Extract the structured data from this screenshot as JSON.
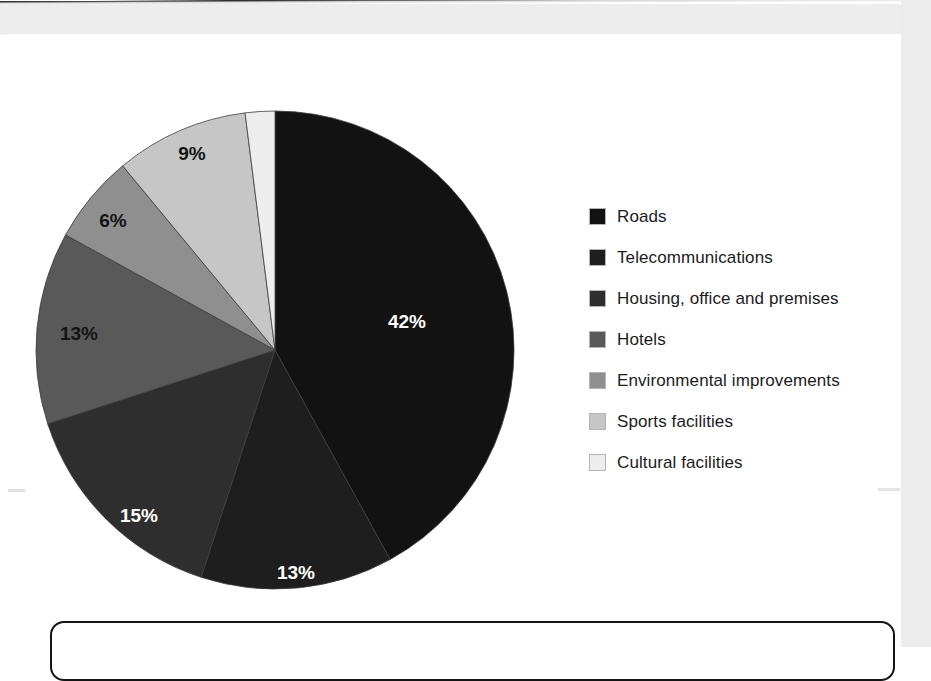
{
  "chart_data": {
    "type": "pie",
    "title": "",
    "subtitle": "",
    "xlabel": "",
    "ylabel": "",
    "grid": false,
    "legend_position": "right",
    "start_angle_deg": 0,
    "direction": "clockwise",
    "unit": "%",
    "categories": [
      "Roads",
      "Telecommunications",
      "Housing, office and premises",
      "Hotels",
      "Environmental improvements",
      "Sports facilities",
      "Cultural facilities"
    ],
    "values": [
      42,
      13,
      15,
      13,
      6,
      9,
      2
    ],
    "value_labels": [
      "42%",
      "13%",
      "15%",
      "13%",
      "6%",
      "9%",
      "2%"
    ],
    "colors": [
      "#121212",
      "#1e1e1e",
      "#2e2e2e",
      "#595959",
      "#8f8f8f",
      "#c6c6c6",
      "#ededed"
    ],
    "label_text_colors": [
      "#ffffff",
      "#ffffff",
      "#ffffff",
      "#141414",
      "#141414",
      "#141414",
      "#141414"
    ],
    "slices": [
      {
        "label": "Roads",
        "value": 42,
        "display": "42%",
        "color": "#121212",
        "label_color": "#ffffff",
        "label_x": 372,
        "label_y": 213
      },
      {
        "label": "Telecommunications",
        "value": 13,
        "display": "13%",
        "color": "#1e1e1e",
        "label_color": "#ffffff",
        "label_x": 261,
        "label_y": 464
      },
      {
        "label": "Housing, office and premises",
        "value": 15,
        "display": "15%",
        "color": "#2e2e2e",
        "label_color": "#ffffff",
        "label_x": 104,
        "label_y": 407
      },
      {
        "label": "Hotels",
        "value": 13,
        "display": "13%",
        "color": "#595959",
        "label_color": "#141414",
        "label_x": 44,
        "label_y": 225
      },
      {
        "label": "Environmental improvements",
        "value": 6,
        "display": "6%",
        "color": "#8f8f8f",
        "label_color": "#141414",
        "label_x": 78,
        "label_y": 112
      },
      {
        "label": "Sports facilities",
        "value": 9,
        "display": "9%",
        "color": "#c6c6c6",
        "label_color": "#141414",
        "label_x": 157,
        "label_y": 45
      },
      {
        "label": "Cultural facilities",
        "value": 2,
        "display": "2%",
        "color": "#ededed",
        "label_color": "#141414",
        "label_x": 222,
        "label_y": -17
      }
    ],
    "geometry": {
      "center_x": 240,
      "center_y": 240,
      "radius": 239
    }
  },
  "legend": {
    "items": [
      {
        "label": "Roads",
        "color": "#121212"
      },
      {
        "label": "Telecommunications",
        "color": "#1e1e1e"
      },
      {
        "label": "Housing, office and premises",
        "color": "#2e2e2e"
      },
      {
        "label": "Hotels",
        "color": "#595959"
      },
      {
        "label": "Environmental improvements",
        "color": "#8f8f8f"
      },
      {
        "label": "Sports facilities",
        "color": "#c6c6c6"
      },
      {
        "label": "Cultural facilities",
        "color": "#ededed"
      }
    ]
  }
}
